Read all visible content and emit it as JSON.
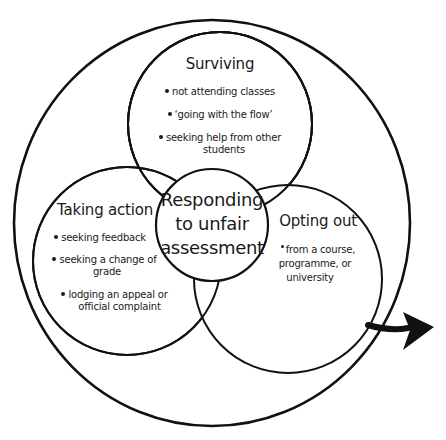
{
  "colors": {
    "stroke": "#111111",
    "background": "#ffffff",
    "text": "#1a1a1a"
  },
  "center": {
    "lines": [
      "Responding",
      "to unfair",
      "assessment"
    ]
  },
  "surviving": {
    "title": "Surviving",
    "bullets": [
      "not attending classes",
      "‘going with the flow’",
      "seeking help from other",
      "students"
    ]
  },
  "taking_action": {
    "title": "Taking action",
    "bullets": [
      "seeking feedback",
      "seeking a change of",
      "grade",
      "lodging an appeal or",
      "official complaint"
    ]
  },
  "opting_out": {
    "title": "Opting out",
    "bullets": [
      "from a course,",
      "programme, or",
      "university"
    ]
  },
  "arrow": {
    "icon": "exit-arrow-icon",
    "direction": "right"
  }
}
